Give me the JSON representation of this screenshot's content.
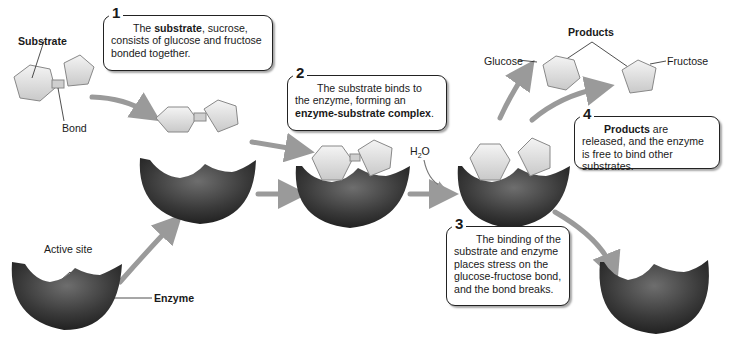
{
  "labels": {
    "substrate": "Substrate",
    "bond": "Bond",
    "active_site": "Active site",
    "enzyme": "Enzyme",
    "water": "H",
    "water_sub": "2",
    "water_o": "O",
    "products": "Products",
    "glucose": "Glucose",
    "fructose": "Fructose"
  },
  "steps": [
    {
      "number": "1",
      "parts": [
        {
          "text": "The ",
          "bold": false
        },
        {
          "text": "substrate",
          "bold": true
        },
        {
          "text": ", sucrose, consists of glucose and fructose bonded together.",
          "bold": false
        }
      ]
    },
    {
      "number": "2",
      "parts": [
        {
          "text": "The substrate binds to the enzyme, forming an ",
          "bold": false
        },
        {
          "text": "enzyme-substrate complex",
          "bold": true
        },
        {
          "text": ".",
          "bold": false
        }
      ]
    },
    {
      "number": "3",
      "parts": [
        {
          "text": "The binding of the substrate and enzyme places stress on the glucose-fructose bond, and the bond breaks.",
          "bold": false
        }
      ]
    },
    {
      "number": "4",
      "parts": [
        {
          "text": "Products",
          "bold": true
        },
        {
          "text": " are released, and the enzyme is free to bind other substrates.",
          "bold": false
        }
      ]
    }
  ],
  "colors": {
    "enzyme_dark": "#2b2b2b",
    "enzyme_mid": "#5a5a5a",
    "substrate_light": "#e6e6e6",
    "arrow": "#9a9a9a",
    "callout_border": "#222222"
  }
}
